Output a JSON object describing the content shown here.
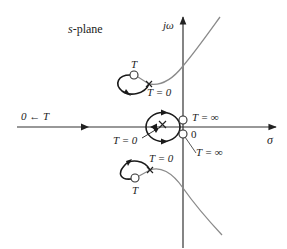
{
  "diagram": {
    "title": "s-plane",
    "plane_label_italic": "s",
    "plane_label_rest": "-plane",
    "axes": {
      "imaginary_label": "jω",
      "real_label": "σ",
      "origin_label": "0"
    },
    "labels": {
      "left_limit": "0 ← T",
      "upper_T": "T",
      "upper_T0": "T = 0",
      "center_Tinf_top": "T = ∞",
      "center_T0": "T = 0",
      "center_Tinf_bottom": "T = ∞",
      "lower_T0": "T = 0",
      "lower_T": "T"
    },
    "colors": {
      "locus_dark": "#1a1a1a",
      "locus_gray": "#8a8a8a",
      "axis": "#333333"
    }
  }
}
